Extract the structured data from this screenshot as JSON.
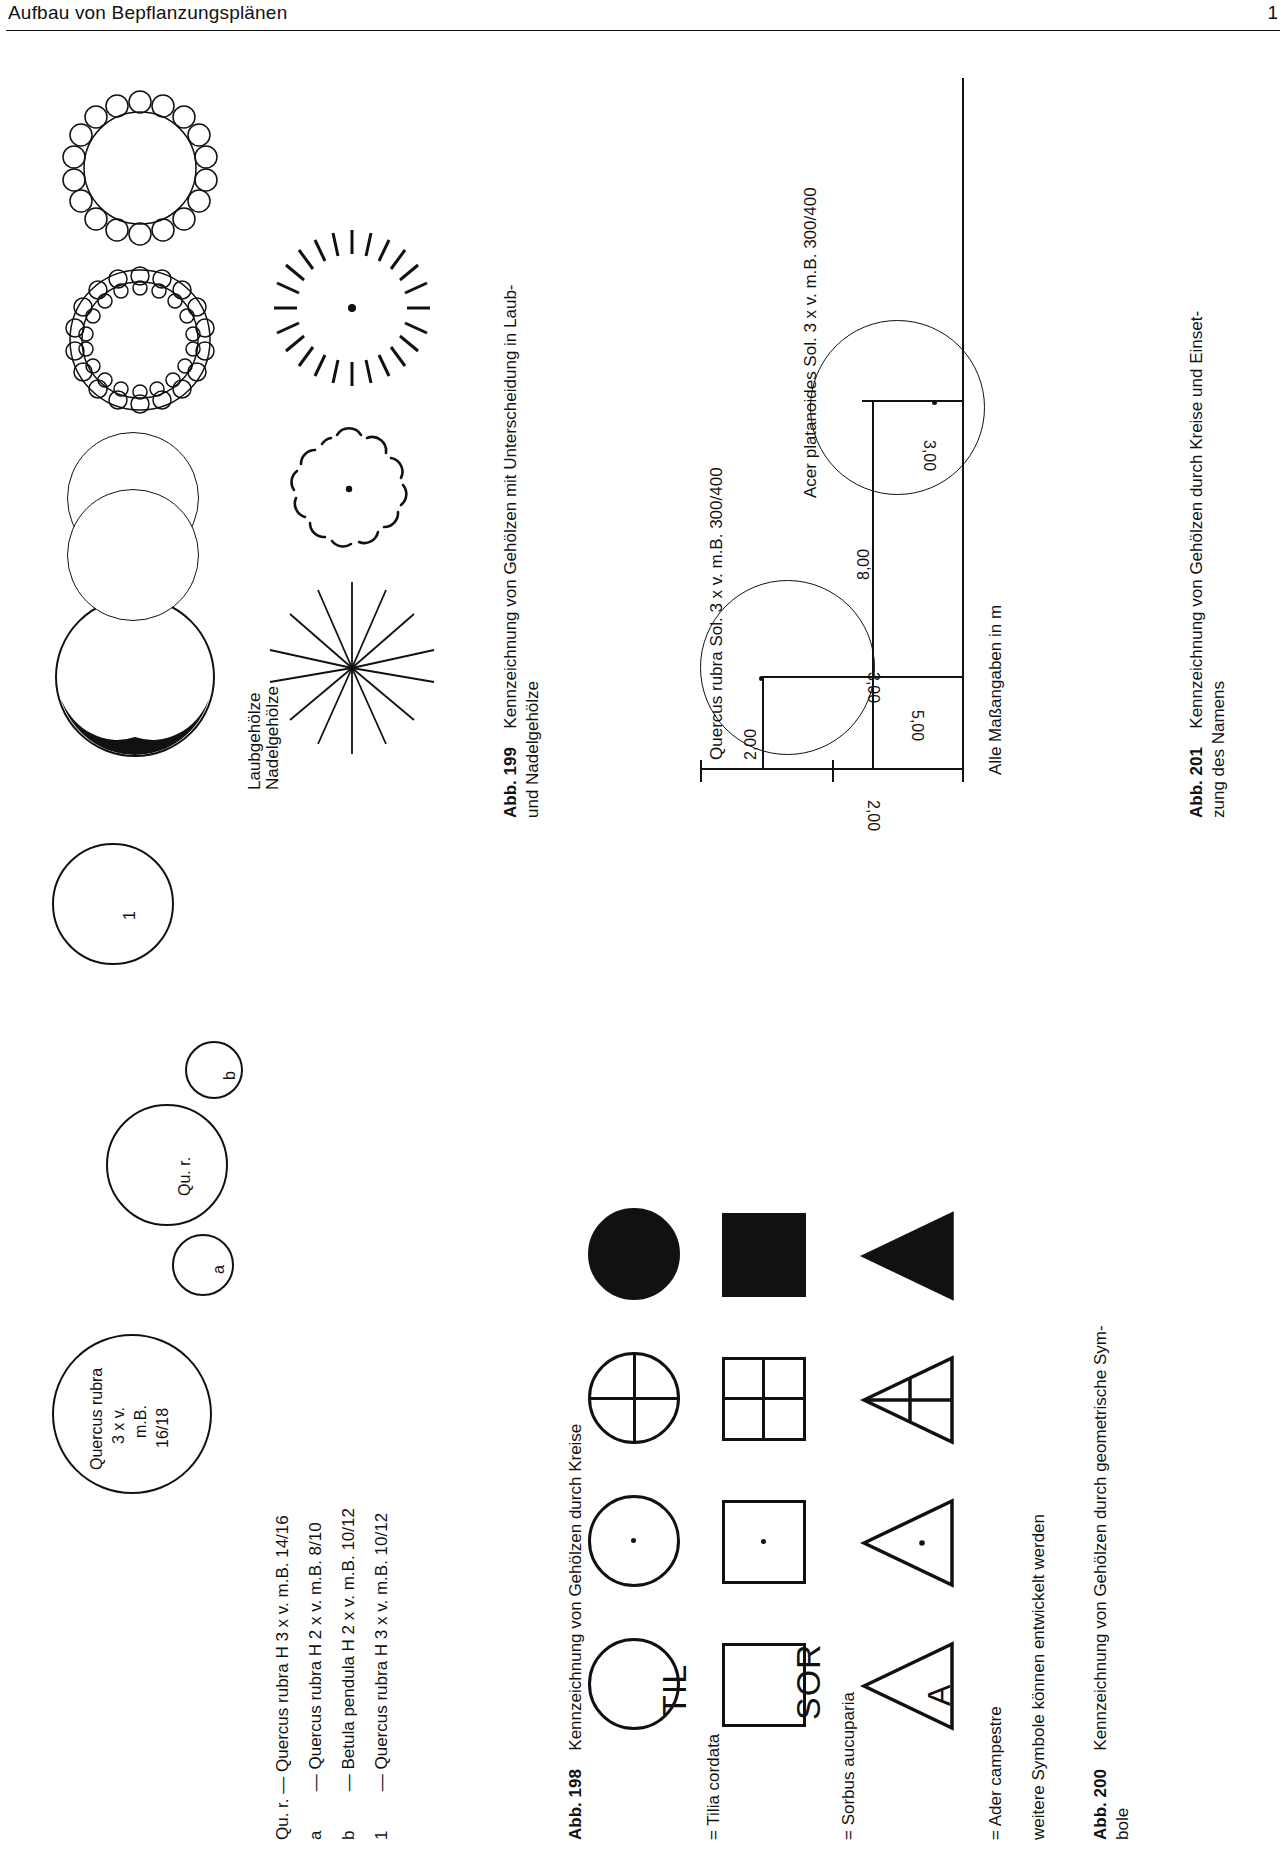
{
  "header": {
    "title": "Aufbau von Bepflanzungsplänen",
    "page_number": "1"
  },
  "figures": {
    "abb198": {
      "number": "Abb. 198",
      "caption": "Kennzeichnung von Gehölzen durch Kreise",
      "plan_labels": {
        "main_circle": "Quercus rubra\n3 x v.\nm.B.\n16/18",
        "main_circle_l1": "Quercus rubra",
        "main_circle_l2": "3 x v.",
        "main_circle_l3": "m.B.",
        "main_circle_l4": "16/18",
        "qu_r": "Qu. r.",
        "a": "a",
        "b": "b",
        "one": "1"
      },
      "legend": [
        {
          "key": "Qu. r.",
          "dash": "—",
          "text": "Quercus rubra H 3 x v. m.B. 14/16"
        },
        {
          "key": "a",
          "dash": "—",
          "text": "Quercus rubra H 2 x v. m.B.  8/10"
        },
        {
          "key": "b",
          "dash": "—",
          "text": "Betula pendula H 2 x v. m.B. 10/12"
        },
        {
          "key": "1",
          "dash": "—",
          "text": "Quercus rubra H 3 x v. m.B. 10/12"
        }
      ]
    },
    "abb199": {
      "number": "Abb. 199",
      "caption_line1": "Kennzeichnung von Gehölzen mit Unterscheidung in Laub-",
      "caption_line2": "und Nadelgehölze",
      "group_labels": {
        "laub": "Laubgehölze",
        "nadel": "Nadelgehölze"
      }
    },
    "abb200": {
      "number": "Abb. 200",
      "caption_line1": "Kennzeichnung von Gehölzen durch geometrische Sym-",
      "caption_line2": "bole",
      "rows": [
        {
          "symbol_text": "TIL",
          "equals": "= Tilia cordata",
          "shape": "circle"
        },
        {
          "symbol_text": "SOR",
          "equals": "= Sorbus aucuparia",
          "shape": "square"
        },
        {
          "symbol_text": "A",
          "equals": "= Ader campestre",
          "shape": "triangle"
        }
      ],
      "note": "weitere Symbole können entwickelt werden"
    },
    "abb201": {
      "number": "Abb. 201",
      "caption_line1": "Kennzeichnung von Gehölzen durch Kreise und Einset-",
      "caption_line2": "zung des Namens",
      "species": [
        "Quercus rubra Sol. 3 x v. m.B. 300/400",
        "Acer platanoides Sol. 3 x v. m.B. 300/400"
      ],
      "dimensions": {
        "d_2_00": "2,00",
        "d_3_00_vert": "3,00",
        "d_8_00": "8,00",
        "d_5_00": "5,00",
        "d_2_00_base": "2,00",
        "d_3_00_base": "3,00"
      },
      "note": "Alle Maßangaben in m"
    }
  }
}
